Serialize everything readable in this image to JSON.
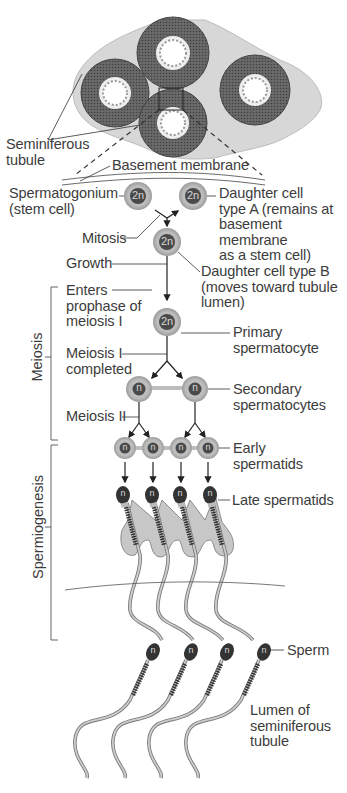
{
  "figure": {
    "colors": {
      "line": "#333333",
      "cell_outer": "#b8b8b8",
      "cell_nucleus": "#4a4a4a",
      "tissue": "#d9d9d9",
      "tubule_wall": "#555555",
      "text": "#3c3c3c"
    }
  },
  "labels": {
    "seminiferous_tubule": [
      "Seminiferous",
      "tubule"
    ],
    "basement_membrane": "Basement membrane",
    "spermatogonium": [
      "Spermatogonium",
      "(stem cell)"
    ],
    "daughter_a": [
      "Daughter cell",
      "type A (remains at",
      "basement",
      "membrane",
      "as a stem cell)"
    ],
    "mitosis": "Mitosis",
    "growth": "Growth",
    "daughter_b": [
      "Daughter cell type B",
      "(moves toward tubule",
      "lumen)"
    ],
    "enters_prophase": [
      "Enters",
      "prophase of",
      "meiosis I"
    ],
    "primary_spermatocyte": [
      "Primary",
      "spermatocyte"
    ],
    "meiosis_i_completed": [
      "Meiosis I",
      "completed"
    ],
    "secondary_spermatocytes": [
      "Secondary",
      "spermatocytes"
    ],
    "meiosis_ii": "Meiosis II",
    "early_spermatids": [
      "Early",
      "spermatids"
    ],
    "late_spermatids": "Late spermatids",
    "sperm": "Sperm",
    "lumen": [
      "Lumen of",
      "seminiferous",
      "tubule"
    ]
  },
  "brackets": {
    "meiosis": "Meiosis",
    "spermiogenesis": "Spermiogenesis"
  },
  "ploidy": {
    "diploid": "2n",
    "haploid": "n"
  }
}
